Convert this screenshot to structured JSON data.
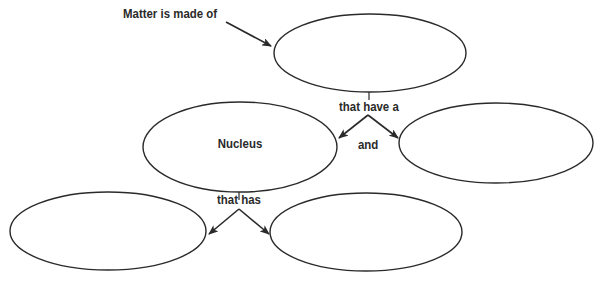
{
  "diagram": {
    "type": "concept-map",
    "stroke_color": "#2a2a2a",
    "background": "#ffffff",
    "intro_text": "Matter is made of",
    "nodes": [
      {
        "id": "top",
        "label": "",
        "cx": 370,
        "cy": 53,
        "rx": 96,
        "ry": 39
      },
      {
        "id": "nucleus",
        "label": "Nucleus",
        "cx": 240,
        "cy": 147,
        "rx": 97,
        "ry": 45
      },
      {
        "id": "right-middle",
        "label": "",
        "cx": 496,
        "cy": 143,
        "rx": 97,
        "ry": 40
      },
      {
        "id": "bottom-left",
        "label": "",
        "cx": 108,
        "cy": 231,
        "rx": 98,
        "ry": 39
      },
      {
        "id": "bottom-right",
        "label": "",
        "cx": 366,
        "cy": 232,
        "rx": 96,
        "ry": 39
      }
    ],
    "linking_phrases": {
      "top_to_middle": "that have a",
      "between_middle": "and",
      "nucleus_to_bottom": "that has"
    }
  }
}
